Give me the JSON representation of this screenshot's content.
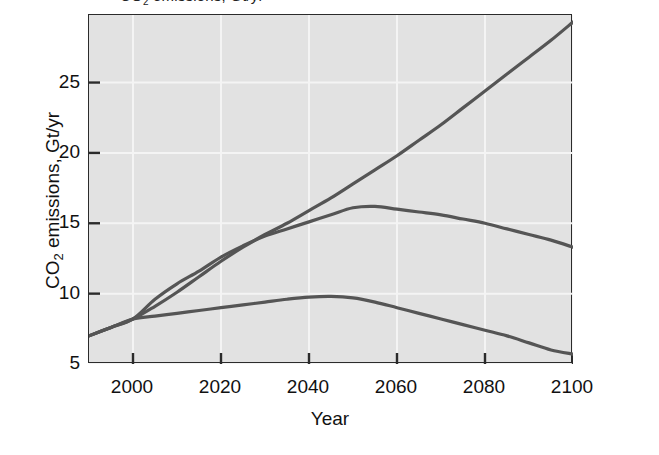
{
  "figure": {
    "title_fragment": "CO2 emissions, Gt/yr",
    "title_visible_note": "clipped at top of image"
  },
  "chart_data": {
    "type": "line",
    "title": "",
    "xlabel": "Year",
    "ylabel": "CO2 emissions, Gt/yr",
    "xlim": [
      1990,
      2100
    ],
    "ylim": [
      5,
      29.8
    ],
    "xticks": [
      2000,
      2020,
      2040,
      2060,
      2080,
      2100
    ],
    "xtick_labels": [
      "2000",
      "2020",
      "2040",
      "2060",
      "2080",
      "2100"
    ],
    "yticks": [
      5,
      10,
      15,
      20,
      25
    ],
    "ytick_labels": [
      "5",
      "10",
      "15",
      "20",
      "25"
    ],
    "grid": true,
    "grid_color": "#f4f4f4",
    "plot_background": "#e2e2e2",
    "line_color": "#555555",
    "line_width": 3.2,
    "legend": "none",
    "series": [
      {
        "name": "High scenario",
        "color": "#555555",
        "x": [
          1990,
          1995,
          2000,
          2005,
          2010,
          2015,
          2020,
          2025,
          2030,
          2035,
          2040,
          2045,
          2050,
          2055,
          2060,
          2065,
          2070,
          2075,
          2080,
          2085,
          2090,
          2095,
          2100
        ],
        "values": [
          7.0,
          7.6,
          8.2,
          9.1,
          10.1,
          11.2,
          12.3,
          13.3,
          14.2,
          15.0,
          15.9,
          16.8,
          17.8,
          18.8,
          19.8,
          20.9,
          22.0,
          23.2,
          24.4,
          25.6,
          26.8,
          28.0,
          29.3
        ]
      },
      {
        "name": "Medium scenario",
        "color": "#555555",
        "x": [
          1990,
          1995,
          2000,
          2005,
          2010,
          2015,
          2020,
          2025,
          2030,
          2035,
          2040,
          2045,
          2050,
          2055,
          2060,
          2065,
          2070,
          2075,
          2080,
          2085,
          2090,
          2095,
          2100
        ],
        "values": [
          7.0,
          7.6,
          8.2,
          9.6,
          10.7,
          11.6,
          12.6,
          13.4,
          14.1,
          14.6,
          15.1,
          15.6,
          16.1,
          16.2,
          16.0,
          15.8,
          15.6,
          15.3,
          15.0,
          14.6,
          14.2,
          13.8,
          13.3
        ]
      },
      {
        "name": "Low scenario",
        "color": "#555555",
        "x": [
          1990,
          1995,
          2000,
          2005,
          2010,
          2015,
          2020,
          2025,
          2030,
          2035,
          2040,
          2045,
          2050,
          2055,
          2060,
          2065,
          2070,
          2075,
          2080,
          2085,
          2090,
          2095,
          2100
        ],
        "values": [
          7.0,
          7.6,
          8.2,
          8.4,
          8.6,
          8.8,
          9.0,
          9.2,
          9.4,
          9.6,
          9.75,
          9.8,
          9.7,
          9.4,
          9.0,
          8.6,
          8.2,
          7.8,
          7.4,
          7.0,
          6.5,
          6.0,
          5.7
        ]
      }
    ],
    "annotations": [
      {
        "text": "three scenario curves converge at about 8.2 Gt/yr near year 2000",
        "type": "note"
      }
    ]
  }
}
